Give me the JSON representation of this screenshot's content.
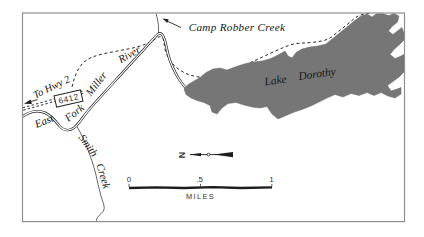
{
  "figure": {
    "type": "trail-map",
    "region_labels": {
      "camp_robber_creek": "Camp Robber Creek",
      "lake": "Lake",
      "dorothy": "Dorothy",
      "miller": "Miller",
      "river": "River",
      "east": "East",
      "fork": "Fork",
      "smith": "Smith",
      "creek": "Creek",
      "to_hwy_2": "To Hwy 2",
      "road_number": "6412"
    },
    "north_arrow": {
      "label": "N",
      "direction": "left"
    },
    "scale_bar": {
      "tick_0": "0",
      "tick_half": ".5",
      "tick_1": "1",
      "unit": "MILES"
    },
    "colors": {
      "lake_fill": "#767676",
      "line_color": "#1c1c1c",
      "frame_color": "#909090",
      "background": "#ffffff"
    }
  }
}
